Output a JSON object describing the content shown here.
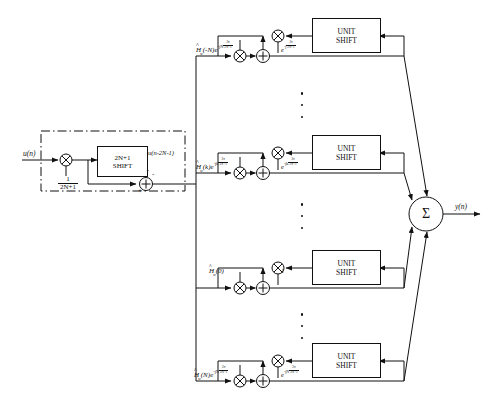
{
  "diagram": {
    "input_label": "u(n)",
    "output_label": "y(n)",
    "prefilter": {
      "gain_num": "1",
      "gain_den": "2N+1",
      "shift_block_line1": "2N+1",
      "shift_block_line2": "SHIFT",
      "shift_output_label": "u(n-2N-1)",
      "adder_plus": "+",
      "adder_minus": "-"
    },
    "branches": [
      {
        "id": "branch-minus-n",
        "coeff_prefix": "H",
        "coeff_sub": "w",
        "coeff_arg": "(-N)",
        "coeff_exp_base": "e",
        "coeff_exp_sign": "-j",
        "coeff_exp_factor": "N",
        "coeff_exp_num": "2π",
        "coeff_exp_den": "2N+1",
        "feedback_label_base": "e",
        "feedback_label_sign": "-j",
        "feedback_num": "2π",
        "feedback_den": "2N+1",
        "unit_shift_line1": "UNIT",
        "unit_shift_line2": "SHIFT"
      },
      {
        "id": "branch-k",
        "coeff_prefix": "H",
        "coeff_sub": "w",
        "coeff_arg": "(k)",
        "coeff_exp_base": "e",
        "coeff_exp_sign": "-jk",
        "coeff_exp_factor": "",
        "coeff_exp_num": "2π",
        "coeff_exp_den": "2N+1",
        "feedback_label_base": "e",
        "feedback_label_sign": "-jk",
        "feedback_num": "2π",
        "feedback_den": "2N+1",
        "unit_shift_line1": "UNIT",
        "unit_shift_line2": "SHIFT"
      },
      {
        "id": "branch-zero",
        "coeff_prefix": "H",
        "coeff_sub": "w",
        "coeff_arg": "(0)",
        "coeff_exp_base": "",
        "coeff_exp_sign": "",
        "coeff_exp_factor": "",
        "coeff_exp_num": "",
        "coeff_exp_den": "",
        "feedback_label_base": "1",
        "feedback_label_sign": "",
        "feedback_num": "",
        "feedback_den": "",
        "unit_shift_line1": "UNIT",
        "unit_shift_line2": "SHIFT"
      },
      {
        "id": "branch-plus-n",
        "coeff_prefix": "H",
        "coeff_sub": "w",
        "coeff_arg": "(N)",
        "coeff_exp_base": "e",
        "coeff_exp_sign": "-jN",
        "coeff_exp_factor": "",
        "coeff_exp_num": "2π",
        "coeff_exp_den": "2N+1",
        "feedback_label_base": "e",
        "feedback_label_sign": "-jN",
        "feedback_num": "2π",
        "feedback_den": "2N+1",
        "unit_shift_line1": "UNIT",
        "unit_shift_line2": "SHIFT"
      }
    ],
    "summer_symbol": "Σ",
    "ellipsis_symbol": "vertical-dots"
  }
}
